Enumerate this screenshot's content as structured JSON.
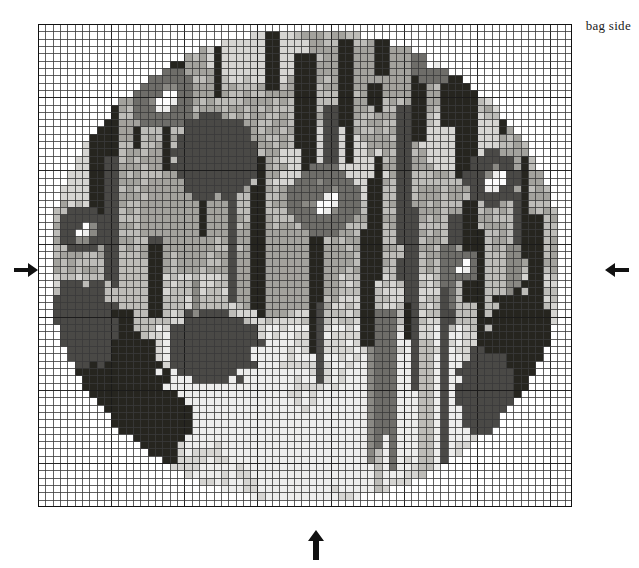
{
  "document": {
    "type": "needlepoint-chart",
    "title": "bag side"
  },
  "caption": {
    "text": "bag side"
  },
  "grid": {
    "cols": 73,
    "rows": 66,
    "cell_px": 7.315,
    "heavy_every": 10,
    "line_color": "#3a3a3a",
    "heavy_color": "#1a1a1a",
    "background": "#ffffff",
    "origin_x": 38,
    "origin_y": 24,
    "width_px": 534,
    "height_px": 483
  },
  "markers": [
    {
      "name": "center-arrow-left",
      "direction": "right",
      "axis": "horizontal",
      "x": 14,
      "y": 258
    },
    {
      "name": "center-arrow-right",
      "direction": "left",
      "axis": "horizontal",
      "x": 605,
      "y": 258
    },
    {
      "name": "center-arrow-bottom",
      "direction": "up",
      "axis": "vertical",
      "x": 304,
      "y": 520
    }
  ],
  "palette": {
    "empty": "#ffffff",
    "white": "#fdfdfd",
    "pale": "#ededec",
    "light": "#d6d5d2",
    "midlight": "#bdbcb8",
    "mid": "#a3a29d",
    "middark": "#8a8984",
    "dark": "#6e6d69",
    "darker": "#4a4946",
    "black": "#26251f"
  },
  "chart_data": {
    "type": "heatmap",
    "title": "bag side",
    "xlabel": "",
    "ylabel": "",
    "cols": 73,
    "rows": 66,
    "legend": [
      {
        "symbol": "empty",
        "color": "#ffffff",
        "label": "unstitched"
      },
      {
        "symbol": "white",
        "color": "#fdfdfd",
        "label": "white highlight"
      },
      {
        "symbol": "pale",
        "color": "#ededec",
        "label": "pale grey"
      },
      {
        "symbol": "light",
        "color": "#d6d5d2",
        "label": "light grey"
      },
      {
        "symbol": "midlight",
        "color": "#bdbcb8",
        "label": "medium light grey"
      },
      {
        "symbol": "mid",
        "color": "#a3a29d",
        "label": "medium grey"
      },
      {
        "symbol": "middark",
        "color": "#8a8984",
        "label": "medium dark grey"
      },
      {
        "symbol": "dark",
        "color": "#6e6d69",
        "label": "dark grey"
      },
      {
        "symbol": "darker",
        "color": "#4a4946",
        "label": "charcoal"
      },
      {
        "symbol": "black",
        "color": "#26251f",
        "label": "black"
      }
    ],
    "shape": {
      "kind": "oval",
      "cx": 36.5,
      "cy": 33.0,
      "rx": 35.0,
      "ry": 32.2
    },
    "regions": [
      {
        "name": "upper-field",
        "y0": 0,
        "y1": 22,
        "base": "mid"
      },
      {
        "name": "middle-field",
        "y0": 22,
        "y1": 42,
        "base": "midlight"
      },
      {
        "name": "lower-field",
        "y0": 42,
        "y1": 66,
        "base": "pale"
      }
    ],
    "motifs": [
      {
        "name": "flower-upper-left",
        "cx": 17,
        "cy": 10,
        "r": 4.4,
        "petal": "dark",
        "core": "white"
      },
      {
        "name": "flower-center",
        "cx": 39,
        "cy": 24,
        "r": 4.8,
        "petal": "dark",
        "core": "white"
      },
      {
        "name": "flower-upper-right",
        "cx": 54,
        "cy": 5,
        "r": 3.4,
        "petal": "dark",
        "core": "white"
      },
      {
        "name": "flower-right",
        "cx": 62,
        "cy": 21,
        "r": 3.8,
        "petal": "darker",
        "core": "white"
      },
      {
        "name": "flower-left",
        "cx": 6,
        "cy": 28,
        "r": 3.4,
        "petal": "darker",
        "core": "white"
      },
      {
        "name": "bud-mid-right",
        "cx": 58,
        "cy": 33,
        "r": 2.3,
        "petal": "dark",
        "core": "white"
      },
      {
        "name": "leaf-mass-upper-mid",
        "cx": 24,
        "cy": 18,
        "r": 6.0,
        "petal": "darker",
        "core": "darker"
      },
      {
        "name": "leaf-mass-lower-left",
        "cx": 11,
        "cy": 49,
        "r": 6.5,
        "petal": "black",
        "core": "black"
      }
    ],
    "stripes": {
      "note": "vertical dark strokes descending over the field, lighter in lower half",
      "count": 46
    }
  }
}
